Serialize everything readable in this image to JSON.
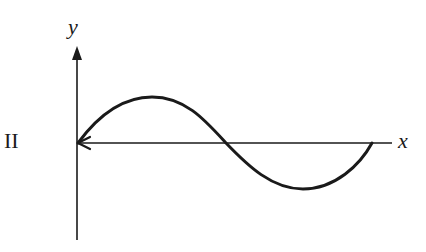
{
  "figure": {
    "panel_label": "II",
    "x_axis_label": "x",
    "y_axis_label": "y",
    "colors": {
      "ink": "#1a1a1a",
      "background": "#ffffff"
    }
  }
}
